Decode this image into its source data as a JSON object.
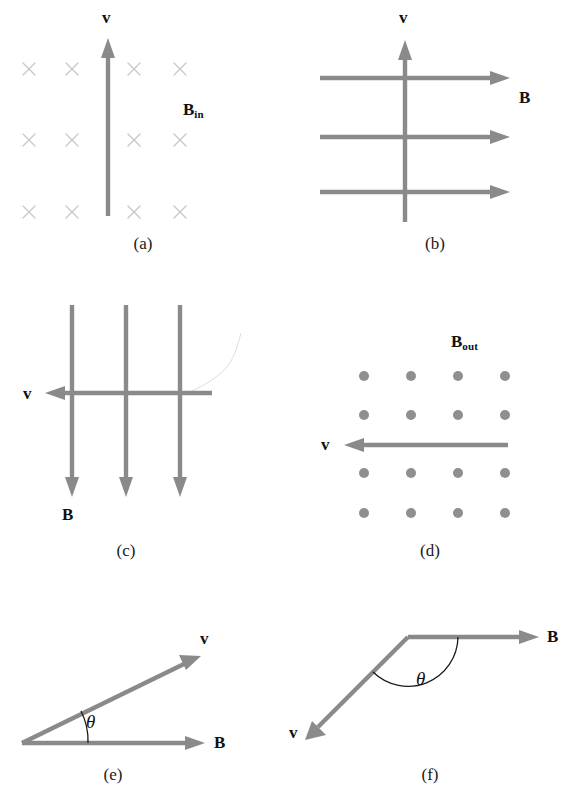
{
  "figure": {
    "background_color": "#ffffff",
    "vector_color": "#8a8a8a",
    "marker_color": "#8f8f8f",
    "cross_color": "#c9c9c9",
    "label_color": "#111111"
  },
  "labels": {
    "v": "v",
    "B": "B",
    "B_in_base": "B",
    "B_in_sub": "in",
    "B_out_base": "B",
    "B_out_sub": "out",
    "theta": "θ"
  },
  "panels": [
    {
      "id": "a",
      "caption": "(a)",
      "field_representation": "crosses-into-page",
      "field_label": "B_in",
      "field_label_text": "Bin",
      "velocity_direction": "up",
      "velocity_label": "v",
      "angle_between_v_and_B_deg": 90,
      "cross_rows": 3,
      "cross_cols": 4
    },
    {
      "id": "b",
      "caption": "(b)",
      "field_representation": "arrows-right",
      "field_label": "B",
      "field_label_text": "B",
      "velocity_direction": "up",
      "velocity_label": "v",
      "angle_between_v_and_B_deg": 90,
      "field_arrow_count": 3
    },
    {
      "id": "c",
      "caption": "(c)",
      "field_representation": "arrows-down",
      "field_label": "B",
      "field_label_text": "B",
      "velocity_direction": "left",
      "velocity_label": "v",
      "angle_between_v_and_B_deg": 90,
      "field_arrow_count": 3
    },
    {
      "id": "d",
      "caption": "(d)",
      "field_representation": "dots-out-of-page",
      "field_label": "B_out",
      "field_label_text": "Bout",
      "velocity_direction": "left",
      "velocity_label": "v",
      "angle_between_v_and_B_deg": 90,
      "dot_rows": 4,
      "dot_cols": 4
    },
    {
      "id": "e",
      "caption": "(e)",
      "field_representation": "single-arrow-right",
      "field_label": "B",
      "field_label_text": "B",
      "velocity_direction": "up-right",
      "velocity_label": "v",
      "angle_label": "θ",
      "angle_between_v_and_B_deg": 26
    },
    {
      "id": "f",
      "caption": "(f)",
      "field_representation": "single-arrow-right",
      "field_label": "B",
      "field_label_text": "B",
      "velocity_direction": "down-left",
      "velocity_label": "v",
      "angle_label": "θ",
      "angle_between_v_and_B_deg": 142
    }
  ]
}
